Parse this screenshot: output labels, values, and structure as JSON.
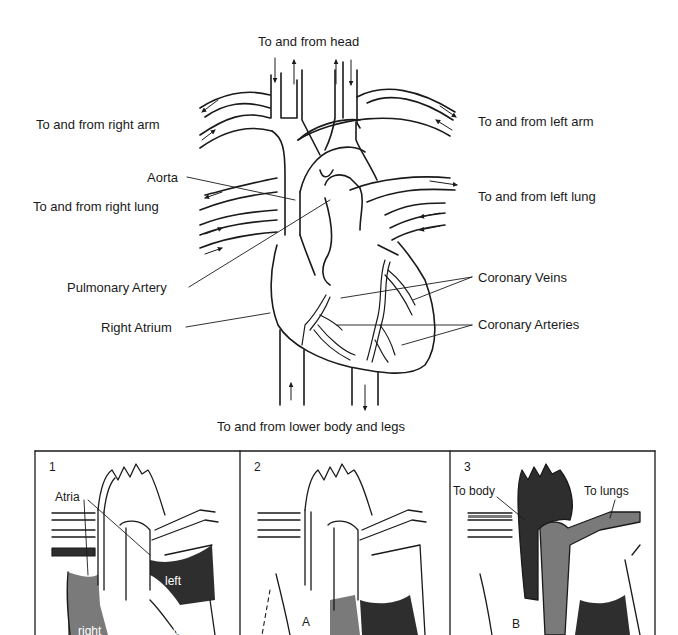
{
  "figure": {
    "main_diagram": {
      "name": "Heart with major vessels",
      "labels": {
        "head": "To and from head",
        "right_arm": "To and from right arm",
        "left_arm": "To and from left arm",
        "aorta": "Aorta",
        "right_lung": "To and from right lung",
        "left_lung": "To and from left lung",
        "pulmonary_artery": "Pulmonary Artery",
        "coronary_veins": "Coronary Veins",
        "right_atrium": "Right Atrium",
        "coronary_arteries": "Coronary Arteries",
        "lower_body": "To and from lower body and legs"
      }
    },
    "panels": [
      {
        "number": "1",
        "labels": {
          "atria": "Atria",
          "left_atrium": "left",
          "right_atrium": "right",
          "left_ventricle": "left"
        }
      },
      {
        "number": "2",
        "labels": {
          "a": "A"
        }
      },
      {
        "number": "3",
        "labels": {
          "to_body": "To body",
          "to_lungs": "To lungs",
          "b": "B"
        }
      }
    ],
    "colors": {
      "line": "#1a1a1a",
      "dark_fill": "#2e2e2e",
      "mid_fill": "#7a7a7a",
      "background": "#ffffff"
    }
  }
}
